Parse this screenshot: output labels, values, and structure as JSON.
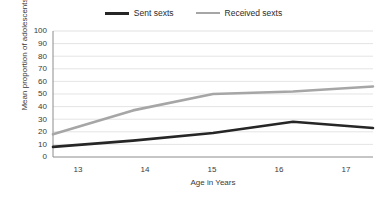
{
  "chart_data": {
    "type": "line",
    "title": "",
    "xlabel": "Age in Years",
    "ylabel": "Mean proportion of adolescents",
    "categories": [
      "13",
      "14",
      "15",
      "16",
      "17"
    ],
    "x": [
      13,
      14,
      15,
      16,
      17
    ],
    "xlim": [
      13,
      17
    ],
    "ylim": [
      0,
      100
    ],
    "yticks": [
      "0",
      "10",
      "20",
      "30",
      "40",
      "50",
      "60",
      "70",
      "80",
      "90",
      "100"
    ],
    "grid": "horizontal",
    "legend_position": "top-center",
    "series": [
      {
        "name": "Sent sexts",
        "color": "#262626",
        "values": [
          8,
          13,
          19,
          28,
          23
        ]
      },
      {
        "name": "Received sexts",
        "color": "#a6a6a6",
        "values": [
          18,
          37,
          50,
          52,
          56
        ]
      }
    ]
  },
  "legend": {
    "items": [
      {
        "label": "Sent sexts",
        "color": "#262626"
      },
      {
        "label": "Received sexts",
        "color": "#a6a6a6"
      }
    ]
  },
  "axes": {
    "y_title": "Mean proportion of adolescents",
    "x_title": "Age in Years",
    "y_ticks": [
      "100",
      "90",
      "80",
      "70",
      "60",
      "50",
      "40",
      "30",
      "20",
      "10",
      "0"
    ],
    "x_ticks": [
      "13",
      "14",
      "15",
      "16",
      "17"
    ]
  },
  "colors": {
    "background": "#ffffff",
    "gridline": "#d9d9d9",
    "axis": "#808080",
    "text": "#3a3a3a",
    "series_sent": "#262626",
    "series_received": "#a6a6a6"
  }
}
